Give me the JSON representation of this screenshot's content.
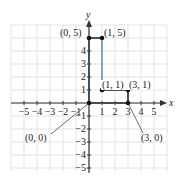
{
  "chart_data": {
    "type": "line",
    "title": "",
    "xlabel": "x",
    "ylabel": "y",
    "xlim": [
      -6,
      6
    ],
    "ylim": [
      -6,
      6
    ],
    "grid": true,
    "x_ticks": [
      -5,
      -4,
      -3,
      -2,
      -1,
      1,
      2,
      3,
      4,
      5
    ],
    "x_tick_labels": [
      "−5",
      "−4",
      "−3",
      "−2",
      "−1",
      "1",
      "2",
      "3",
      "4",
      "5"
    ],
    "y_ticks": [
      -5,
      -4,
      -3,
      -2,
      -1,
      1,
      2,
      3,
      4
    ],
    "y_tick_labels": [
      "−5",
      "−4",
      "−3",
      "−2",
      "−1",
      "1",
      "2",
      "3",
      "4"
    ],
    "series": [
      {
        "name": "polygon",
        "closed": true,
        "color": "#7fa7c9",
        "points": [
          [
            0,
            0
          ],
          [
            0,
            5
          ],
          [
            1,
            5
          ],
          [
            1,
            1
          ],
          [
            3,
            1
          ],
          [
            3,
            0
          ]
        ]
      }
    ],
    "annotations": [
      {
        "text": "(0, 5)",
        "point": [
          0,
          5
        ]
      },
      {
        "text": "(1, 5)",
        "point": [
          1,
          5
        ]
      },
      {
        "text": "(1, 1)",
        "point": [
          1,
          1
        ]
      },
      {
        "text": "(3, 1)",
        "point": [
          3,
          1
        ]
      },
      {
        "text": "(0, 0)",
        "point": [
          0,
          0
        ]
      },
      {
        "text": "(3, 0)",
        "point": [
          3,
          0
        ]
      }
    ]
  },
  "labels": {
    "x_axis": "x",
    "y_axis": "y",
    "p05": "(0, 5)",
    "p15": "(1, 5)",
    "p11": "(1, 1)",
    "p31": "(3, 1)",
    "p00": "(0, 0)",
    "p30": "(3, 0)",
    "xt": [
      "−5",
      "−4",
      "−3",
      "−2",
      "−1",
      "1",
      "2",
      "3",
      "4",
      "5"
    ],
    "yt_pos": [
      "1",
      "2",
      "3",
      "4"
    ],
    "yt_neg": [
      "−1",
      "−2",
      "−3",
      "−4",
      "−5"
    ]
  },
  "colors": {
    "polygon": "#7fa7c9",
    "axis": "#333333",
    "grid": "#e3e3e3",
    "point": "#111111"
  }
}
